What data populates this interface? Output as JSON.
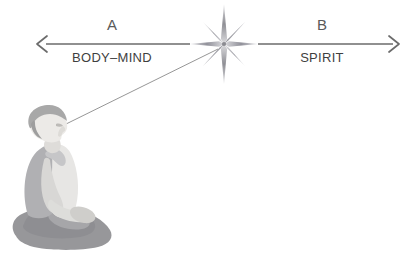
{
  "canvas": {
    "width": 416,
    "height": 259,
    "background": "#ffffff"
  },
  "diagram": {
    "title_text": "",
    "axis": {
      "name": "horizontal-double-arrow-axis",
      "stroke_color": "#6b6b6b",
      "y": 44,
      "left_arrow_tip_x": 36,
      "right_arrow_tip_x": 400,
      "left_segment": {
        "x1": 46,
        "x2": 190
      },
      "right_segment": {
        "x1": 258,
        "x2": 394
      }
    },
    "left_side": {
      "letter": "A",
      "letter_x": 112,
      "letter_y": 30,
      "label": "BODY–MIND",
      "label_x": 112,
      "label_y": 62
    },
    "right_side": {
      "letter": "B",
      "letter_x": 322,
      "letter_y": 30,
      "label": "SPIRIT",
      "label_x": 322,
      "label_y": 62
    },
    "star": {
      "name": "eight-point-sparkle",
      "center_x": 224,
      "center_y": 44,
      "vertical_ray_length": 40,
      "horizontal_ray_length": 34,
      "diagonal_ray_length": 30,
      "color_light": "#d6d6d8",
      "color_dark": "#8d8d92"
    },
    "sight_line": {
      "name": "gaze-line",
      "from_x": 62,
      "from_y": 126,
      "to_x": 218,
      "to_y": 49,
      "stroke_color": "#8a8a8a"
    },
    "figure": {
      "name": "meditating-person",
      "pose": "seated-cross-legged-profile",
      "facing": "right",
      "colors": {
        "skin": "#e9e8e6",
        "skin_shadow": "#dedcda",
        "hair": "#a9a9a9",
        "garment": "#b2b2b2",
        "garment_light": "#c9c9c9",
        "legs": "#9a9a9a",
        "legs_dark": "#8e8e8e"
      }
    }
  }
}
